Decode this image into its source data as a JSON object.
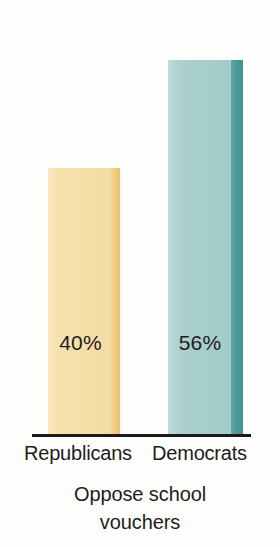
{
  "chart_data": {
    "type": "bar",
    "title": "",
    "caption_lines": [
      "Oppose school",
      "vouchers"
    ],
    "categories": [
      "Republicans",
      "Democrats"
    ],
    "values": [
      40,
      56
    ],
    "value_labels": [
      "40%",
      "56%"
    ],
    "unit": "%",
    "xlabel": "",
    "ylabel": "",
    "ylim": [
      0,
      60
    ],
    "grid": false,
    "legend": "none",
    "axis": {
      "baseline_visible": true,
      "y_axis_visible": false,
      "tick_labels": []
    },
    "series": [
      {
        "name": "Oppose school vouchers",
        "points": [
          {
            "category": "Republicans",
            "value": 40,
            "label": "40%",
            "color": "#f7dfa8",
            "edge_color": "#f1ce7c"
          },
          {
            "category": "Democrats",
            "value": 56,
            "label": "56%",
            "color": "#a8cdcd",
            "edge_color": "#4a9b99"
          }
        ]
      }
    ]
  },
  "colors": {
    "background": "#fdfdfc",
    "republican_bar": "#f7dfa8",
    "republican_bar_edge": "#f1ce7c",
    "democrat_bar": "#a8cdcd",
    "democrat_bar_edge": "#4a9b99",
    "axis_line": "#1b1b1b",
    "text": "#1d1d1d"
  }
}
